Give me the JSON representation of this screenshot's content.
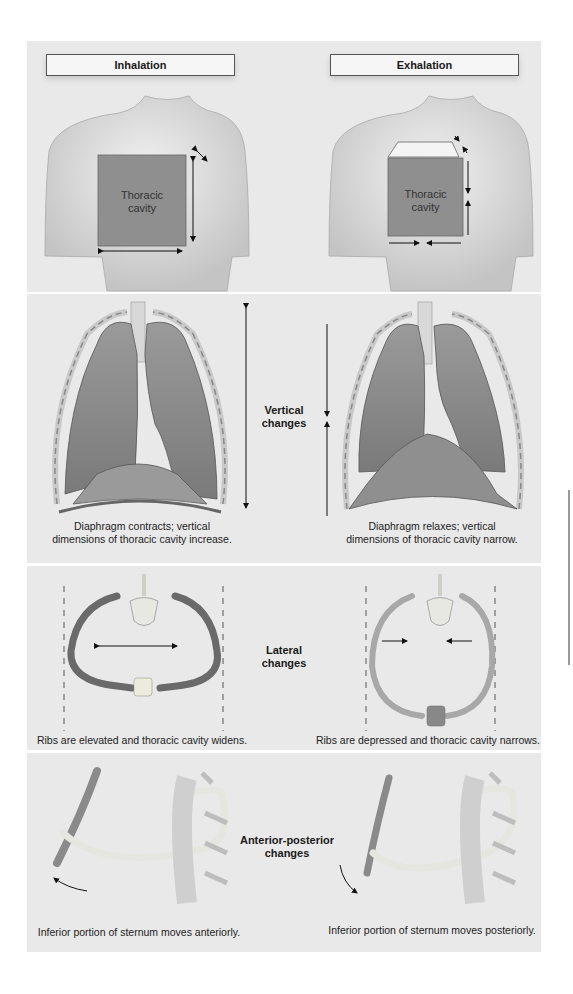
{
  "panels": {
    "torso": {
      "inhalation_title": "Inhalation",
      "exhalation_title": "Exhalation",
      "inhalation_box_label_line1": "Thoracic",
      "inhalation_box_label_line2": "cavity",
      "exhalation_box_label_line1": "Thoracic",
      "exhalation_box_label_line2": "cavity"
    },
    "vertical": {
      "center_label_line1": "Vertical",
      "center_label_line2": "changes",
      "left_caption_line1": "Diaphragm contracts; vertical",
      "left_caption_line2": "dimensions of thoracic cavity increase.",
      "right_caption_line1": "Diaphragm relaxes; vertical",
      "right_caption_line2": "dimensions of thoracic cavity narrow."
    },
    "lateral": {
      "center_label_line1": "Lateral",
      "center_label_line2": "changes",
      "left_caption": "Ribs are elevated and thoracic cavity widens.",
      "right_caption": "Ribs are depressed and thoracic cavity narrows."
    },
    "anterior_posterior": {
      "center_label_line1": "Anterior-posterior",
      "center_label_line2": "changes",
      "left_caption": "Inferior portion of sternum moves anteriorly.",
      "right_caption": "Inferior portion of sternum moves posteriorly."
    }
  },
  "colors": {
    "panel_bg": "#e9e9e9",
    "cavity_fill": "#8f8f8f",
    "lung_fill": "#8a8a8a",
    "rib_dark": "#6a6a6a",
    "rib_light": "#a8a8a8"
  }
}
